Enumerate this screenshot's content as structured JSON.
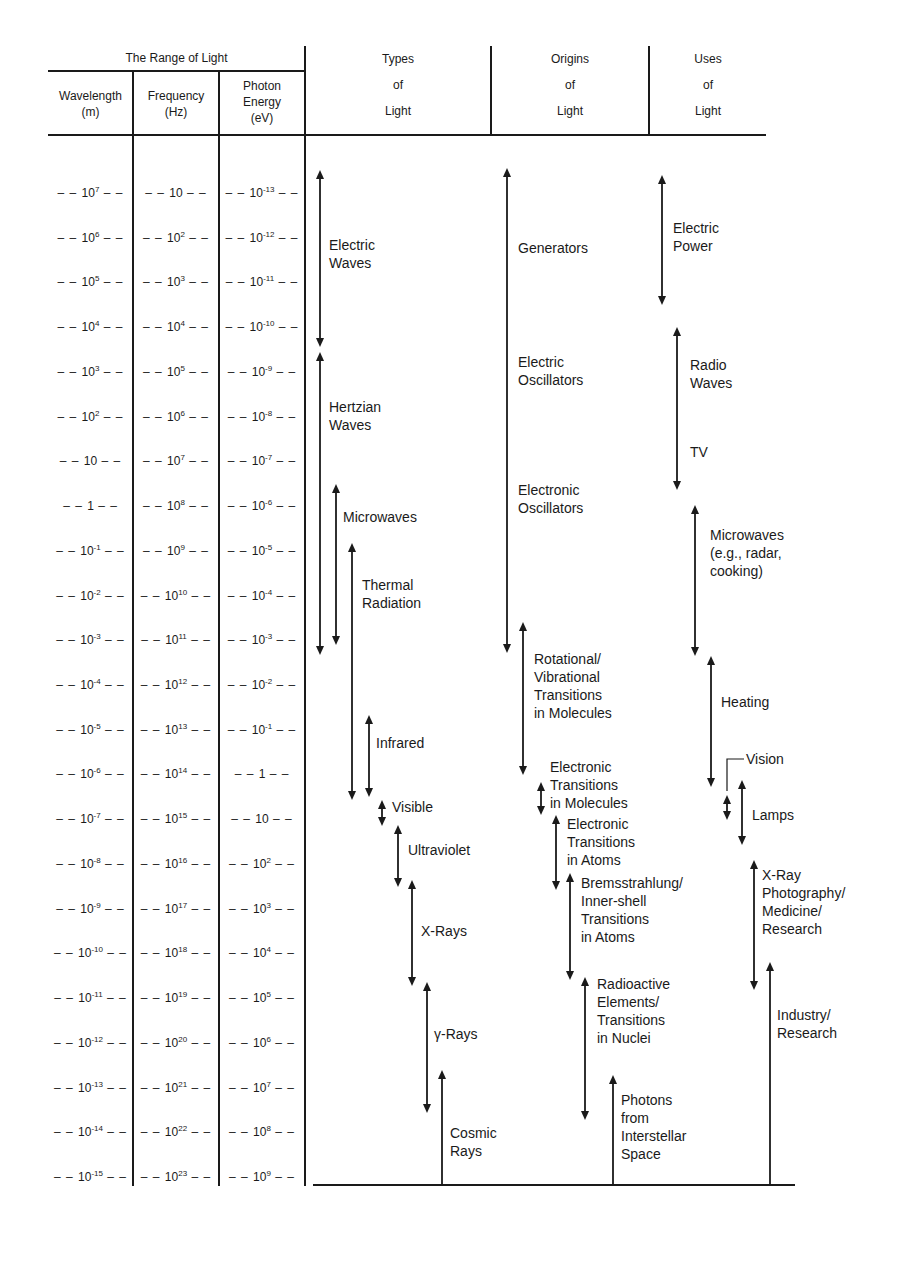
{
  "table": {
    "group_title": "The Range of Light",
    "columns": [
      {
        "key": "wavelength",
        "label_line1": "Wavelength",
        "label_line2": "(m)"
      },
      {
        "key": "frequency",
        "label_line1": "Frequency",
        "label_line2": "(Hz)"
      },
      {
        "key": "energy",
        "label_line1": "Photon",
        "label_line2": "Energy",
        "label_line3": "(eV)"
      }
    ],
    "right_headers": [
      {
        "line1": "Types",
        "line2": "of",
        "line3": "Light"
      },
      {
        "line1": "Origins",
        "line2": "of",
        "line3": "Light"
      },
      {
        "line1": "Uses",
        "line2": "of",
        "line3": "Light"
      }
    ]
  },
  "scale_rows": [
    {
      "wavelength": "10^7",
      "frequency": "10",
      "energy": "10^-13"
    },
    {
      "wavelength": "10^6",
      "frequency": "10^2",
      "energy": "10^-12"
    },
    {
      "wavelength": "10^5",
      "frequency": "10^3",
      "energy": "10^-11"
    },
    {
      "wavelength": "10^4",
      "frequency": "10^4",
      "energy": "10^-10"
    },
    {
      "wavelength": "10^3",
      "frequency": "10^5",
      "energy": "10^-9"
    },
    {
      "wavelength": "10^2",
      "frequency": "10^6",
      "energy": "10^-8"
    },
    {
      "wavelength": "10",
      "frequency": "10^7",
      "energy": "10^-7"
    },
    {
      "wavelength": "1",
      "frequency": "10^8",
      "energy": "10^-6"
    },
    {
      "wavelength": "10^-1",
      "frequency": "10^9",
      "energy": "10^-5"
    },
    {
      "wavelength": "10^-2",
      "frequency": "10^10",
      "energy": "10^-4"
    },
    {
      "wavelength": "10^-3",
      "frequency": "10^11",
      "energy": "10^-3"
    },
    {
      "wavelength": "10^-4",
      "frequency": "10^12",
      "energy": "10^-2"
    },
    {
      "wavelength": "10^-5",
      "frequency": "10^13",
      "energy": "10^-1"
    },
    {
      "wavelength": "10^-6",
      "frequency": "10^14",
      "energy": "1"
    },
    {
      "wavelength": "10^-7",
      "frequency": "10^15",
      "energy": "10"
    },
    {
      "wavelength": "10^-8",
      "frequency": "10^16",
      "energy": "10^2"
    },
    {
      "wavelength": "10^-9",
      "frequency": "10^17",
      "energy": "10^3"
    },
    {
      "wavelength": "10^-10",
      "frequency": "10^18",
      "energy": "10^4"
    },
    {
      "wavelength": "10^-11",
      "frequency": "10^19",
      "energy": "10^5"
    },
    {
      "wavelength": "10^-12",
      "frequency": "10^20",
      "energy": "10^6"
    },
    {
      "wavelength": "10^-13",
      "frequency": "10^21",
      "energy": "10^7"
    },
    {
      "wavelength": "10^-14",
      "frequency": "10^22",
      "energy": "10^8"
    },
    {
      "wavelength": "10^-15",
      "frequency": "10^23",
      "energy": "10^9"
    }
  ],
  "types_of_light": [
    {
      "id": "electric-waves",
      "lines": [
        "Electric",
        "Waves"
      ],
      "x": 320,
      "y1": 170,
      "y2": 347,
      "kind": "double",
      "lx": 329,
      "ly": 236
    },
    {
      "id": "hertzian-waves",
      "lines": [
        "Hertzian",
        "Waves"
      ],
      "x": 320,
      "y1": 352,
      "y2": 655,
      "kind": "double",
      "lx": 329,
      "ly": 398
    },
    {
      "id": "microwaves",
      "lines": [
        "Microwaves"
      ],
      "x": 336,
      "y1": 484,
      "y2": 645,
      "kind": "double",
      "lx": 343,
      "ly": 508
    },
    {
      "id": "thermal-radiation",
      "lines": [
        "Thermal",
        "Radiation"
      ],
      "x": 352,
      "y1": 543,
      "y2": 800,
      "kind": "double",
      "lx": 362,
      "ly": 576
    },
    {
      "id": "infrared",
      "lines": [
        "Infrared"
      ],
      "x": 369,
      "y1": 715,
      "y2": 797,
      "kind": "double",
      "lx": 376,
      "ly": 734
    },
    {
      "id": "visible",
      "lines": [
        "Visible"
      ],
      "x": 382,
      "y1": 800,
      "y2": 826,
      "kind": "double",
      "lx": 392,
      "ly": 798
    },
    {
      "id": "ultraviolet",
      "lines": [
        "Ultraviolet"
      ],
      "x": 398,
      "y1": 825,
      "y2": 887,
      "kind": "double",
      "lx": 408,
      "ly": 841
    },
    {
      "id": "x-rays",
      "lines": [
        "X-Rays"
      ],
      "x": 412,
      "y1": 880,
      "y2": 986,
      "kind": "double",
      "lx": 421,
      "ly": 922
    },
    {
      "id": "gamma-rays",
      "lines": [
        "γ-Rays"
      ],
      "x": 427,
      "y1": 982,
      "y2": 1113,
      "kind": "double",
      "lx": 434,
      "ly": 1025
    },
    {
      "id": "cosmic-rays",
      "lines": [
        "Cosmic",
        "Rays"
      ],
      "x": 442,
      "y1": 1070,
      "y2": 1185,
      "kind": "up",
      "lx": 450,
      "ly": 1124
    }
  ],
  "origins_of_light": [
    {
      "id": "generators",
      "lines": [
        "Generators"
      ],
      "x": 507,
      "y1": 168,
      "y2": 653,
      "kind": "double",
      "lx": 518,
      "ly": 239
    },
    {
      "id": "electric-oscillators",
      "lines": [
        "Electric",
        "Oscillators"
      ],
      "x": 507,
      "y1": 0,
      "y2": 0,
      "kind": "none",
      "lx": 518,
      "ly": 353
    },
    {
      "id": "electronic-oscillators",
      "lines": [
        "Electronic",
        "Oscillators"
      ],
      "x": 507,
      "y1": 0,
      "y2": 0,
      "kind": "none",
      "lx": 518,
      "ly": 481
    },
    {
      "id": "rotational-vibrational",
      "lines": [
        "Rotational/",
        "Vibrational",
        "Transitions",
        "in Molecules"
      ],
      "x": 523,
      "y1": 622,
      "y2": 775,
      "kind": "double",
      "lx": 534,
      "ly": 650
    },
    {
      "id": "electronic-molecules",
      "lines": [
        "Electronic",
        "Transitions",
        "in Molecules"
      ],
      "x": 541,
      "y1": 782,
      "y2": 815,
      "kind": "double",
      "lx": 550,
      "ly": 758
    },
    {
      "id": "electronic-atoms",
      "lines": [
        "Electronic",
        "Transitions",
        "in Atoms"
      ],
      "x": 556,
      "y1": 815,
      "y2": 890,
      "kind": "double",
      "lx": 567,
      "ly": 815
    },
    {
      "id": "bremsstrahlung",
      "lines": [
        "Bremsstrahlung/",
        "Inner-shell",
        "Transitions",
        "in Atoms"
      ],
      "x": 570,
      "y1": 873,
      "y2": 980,
      "kind": "double",
      "lx": 581,
      "ly": 874
    },
    {
      "id": "radioactive",
      "lines": [
        "Radioactive",
        "Elements/",
        "Transitions",
        "in Nuclei"
      ],
      "x": 585,
      "y1": 977,
      "y2": 1120,
      "kind": "double",
      "lx": 597,
      "ly": 975
    },
    {
      "id": "interstellar-photons",
      "lines": [
        "Photons",
        "from",
        "Interstellar",
        "Space"
      ],
      "x": 613,
      "y1": 1075,
      "y2": 1185,
      "kind": "up",
      "lx": 621,
      "ly": 1091
    }
  ],
  "uses_of_light": [
    {
      "id": "electric-power",
      "lines": [
        "Electric",
        "Power"
      ],
      "x": 662,
      "y1": 175,
      "y2": 305,
      "kind": "double",
      "lx": 673,
      "ly": 219
    },
    {
      "id": "radio-waves",
      "lines": [
        "Radio",
        "Waves"
      ],
      "x": 677,
      "y1": 327,
      "y2": 490,
      "kind": "double",
      "lx": 690,
      "ly": 356
    },
    {
      "id": "tv",
      "lines": [
        "TV"
      ],
      "x": 677,
      "y1": 0,
      "y2": 0,
      "kind": "none",
      "lx": 690,
      "ly": 443
    },
    {
      "id": "microwaves-use",
      "lines": [
        "Microwaves",
        "(e.g., radar,",
        "cooking)"
      ],
      "x": 695,
      "y1": 505,
      "y2": 656,
      "kind": "double",
      "lx": 710,
      "ly": 526
    },
    {
      "id": "heating",
      "lines": [
        "Heating"
      ],
      "x": 711,
      "y1": 656,
      "y2": 787,
      "kind": "double",
      "lx": 721,
      "ly": 693
    },
    {
      "id": "vision",
      "lines": [
        "Vision"
      ],
      "x": 727,
      "y1": 795,
      "y2": 820,
      "kind": "double",
      "lx": 746,
      "ly": 750
    },
    {
      "id": "lamps",
      "lines": [
        "Lamps"
      ],
      "x": 742,
      "y1": 780,
      "y2": 845,
      "kind": "double",
      "lx": 752,
      "ly": 806
    },
    {
      "id": "x-ray-photography",
      "lines": [
        "X-Ray",
        "Photography/",
        "Medicine/",
        "Research"
      ],
      "x": 754,
      "y1": 860,
      "y2": 990,
      "kind": "double",
      "lx": 762,
      "ly": 866
    },
    {
      "id": "industry-research",
      "lines": [
        "Industry/",
        "Research"
      ],
      "x": 770,
      "y1": 962,
      "y2": 1185,
      "kind": "up",
      "lx": 777,
      "ly": 1006
    }
  ],
  "colors": {
    "ink": "#1a1a1a",
    "paper": "#ffffff"
  }
}
